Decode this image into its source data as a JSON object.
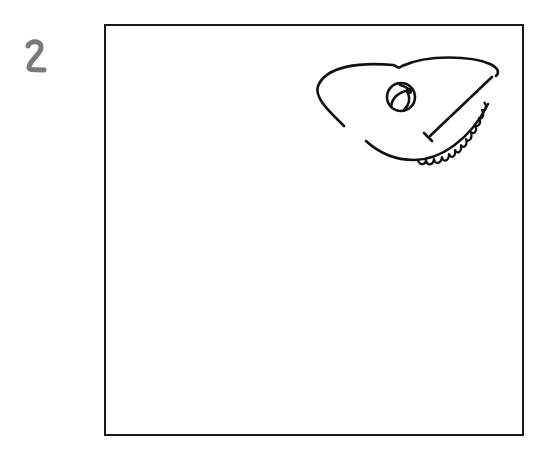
{
  "step": {
    "number": "2",
    "color": "#7a7a7a"
  },
  "frame": {
    "border_color": "#1a1a1a"
  },
  "drawing": {
    "subject": "chameleon-head-sketch",
    "stroke_color": "#111111",
    "parts": [
      "head-outline",
      "casque-crest",
      "eye",
      "mouth-line",
      "jaw-scalloped-edge"
    ]
  }
}
